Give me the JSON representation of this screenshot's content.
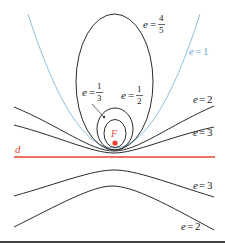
{
  "diagram": {
    "focus_label": "F",
    "directrix_label": "d",
    "colors": {
      "curve": "#2b2b2b",
      "parabola": "#8fbfe0",
      "directrix": "#e8432e",
      "focus": "#e8432e",
      "parabola_label": "#6aa6d6"
    },
    "curves": [
      {
        "id": "ellipse-4-5",
        "label_var": "e",
        "label_eq": "=",
        "label_num": "4",
        "label_den": "5"
      },
      {
        "id": "parabola",
        "label_var": "e",
        "label_eq": "=",
        "label_val": "1"
      },
      {
        "id": "ellipse-1-2",
        "label_var": "e",
        "label_eq": "=",
        "label_num": "1",
        "label_den": "2"
      },
      {
        "id": "ellipse-1-3",
        "label_var": "e",
        "label_eq": "=",
        "label_num": "1",
        "label_den": "3"
      },
      {
        "id": "hyperbola-2-upper",
        "label_var": "e",
        "label_eq": "=",
        "label_val": "2"
      },
      {
        "id": "hyperbola-3-upper",
        "label_var": "e",
        "label_eq": "=",
        "label_val": "3"
      },
      {
        "id": "hyperbola-3-lower",
        "label_var": "e",
        "label_eq": "=",
        "label_val": "3"
      },
      {
        "id": "hyperbola-2-lower",
        "label_var": "e",
        "label_eq": "=",
        "label_val": "2"
      }
    ]
  }
}
